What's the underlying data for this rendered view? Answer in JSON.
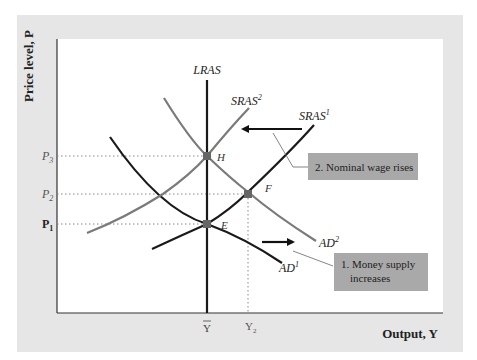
{
  "figure": {
    "y_axis_label": "Price level, P",
    "x_axis_label": "Output, Y",
    "colors": {
      "frame": "#e6e6e6",
      "plot_bg": "#ffffff",
      "dark_curve": "#1a1a1a",
      "gray_curve": "#7a7a7a",
      "callout_bg": "#a9a9a9",
      "point": "#666666"
    }
  },
  "curves": {
    "lras": "LRAS",
    "sras1_base": "SRAS",
    "sras1_sup": "1",
    "sras2_base": "SRAS",
    "sras2_sup": "2",
    "ad1_base": "AD",
    "ad1_sup": "1",
    "ad2_base": "AD",
    "ad2_sup": "2"
  },
  "points": {
    "e": "E",
    "f": "F",
    "h": "H"
  },
  "y_ticks": {
    "p1_base": "P",
    "p1_sub": "1",
    "p2_base": "P",
    "p2_sub": "2",
    "p3_base": "P",
    "p3_sub": "3"
  },
  "x_ticks": {
    "ybar": "Y",
    "y2_base": "Y",
    "y2_sub": "2"
  },
  "callouts": {
    "money_supply_line1": "1. Money supply",
    "money_supply_line2": "increases",
    "nominal_wage": "2. Nominal wage rises"
  }
}
